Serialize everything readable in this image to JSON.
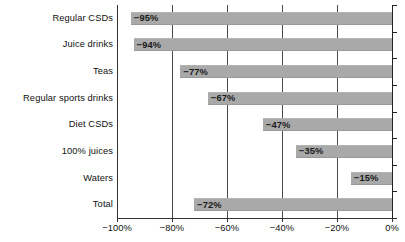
{
  "chart_data": {
    "type": "bar",
    "orientation": "horizontal",
    "title": "",
    "subtitle": "",
    "xlabel": "",
    "ylabel": "",
    "categories": [
      "Regular CSDs",
      "Juice drinks",
      "Teas",
      "Regular sports drinks",
      "Diet CSDs",
      "100% juices",
      "Waters",
      "Total"
    ],
    "values": [
      -95,
      -94,
      -77,
      -67,
      -47,
      -35,
      -15,
      -72
    ],
    "data_labels": [
      "−95%",
      "−94%",
      "−77%",
      "−67%",
      "−47%",
      "−35%",
      "−15%",
      "−72%"
    ],
    "xlim": [
      -100,
      0
    ],
    "xticks": [
      -100,
      -80,
      -60,
      -40,
      -20,
      0
    ],
    "xtick_labels": [
      "−100%",
      "−80%",
      "−60%",
      "−40%",
      "−20%",
      "0%"
    ],
    "grid": true,
    "grid_axis": "x",
    "legend": false,
    "legend_position": "none",
    "bar_color": "#a9a9a9",
    "axis_color": "#333333",
    "text_color": "#111111",
    "background_color": "#ffffff"
  }
}
